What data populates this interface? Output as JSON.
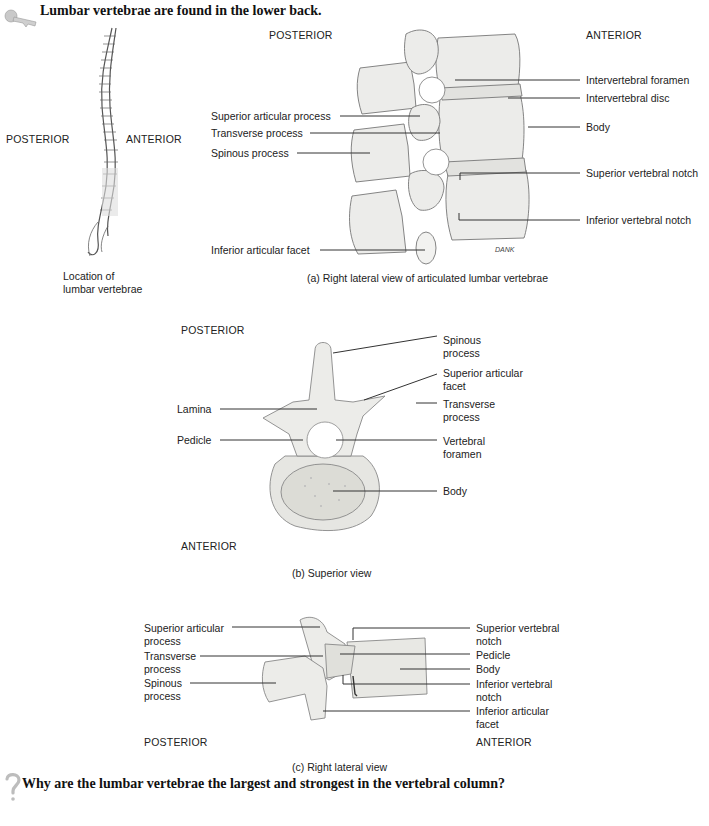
{
  "header": {
    "title": "Lumbar vertebrae are found in the lower back.",
    "key_icon": "key-icon"
  },
  "spine_panel": {
    "posterior": "POSTERIOR",
    "anterior": "ANTERIOR",
    "caption_line1": "Location of",
    "caption_line2": "lumbar vertebrae"
  },
  "panel_a": {
    "posterior": "POSTERIOR",
    "anterior": "ANTERIOR",
    "caption": "(a)  Right lateral view of articulated lumbar vertebrae",
    "signature": "DANK",
    "left_labels": [
      "Superior articular process",
      "Transverse process",
      "Spinous process",
      "Inferior articular facet"
    ],
    "right_labels": [
      "Intervertebral foramen",
      "Intervertebral disc",
      "Body",
      "Superior vertebral notch",
      "Inferior vertebral notch"
    ]
  },
  "panel_b": {
    "posterior": "POSTERIOR",
    "anterior": "ANTERIOR",
    "caption": "(b) Superior view",
    "left_labels": [
      "Lamina",
      "Pedicle"
    ],
    "right_labels": [
      "Spinous\nprocess",
      "Superior articular\nfacet",
      "Transverse\nprocess",
      "Vertebral\nforamen",
      "Body"
    ]
  },
  "panel_c": {
    "posterior": "POSTERIOR",
    "anterior": "ANTERIOR",
    "caption": "(c) Right lateral view",
    "left_labels": [
      "Superior articular\nprocess",
      "Transverse\nprocess",
      "Spinous\nprocess"
    ],
    "right_labels": [
      "Superior vertebral\nnotch",
      "Pedicle",
      "Body",
      "Inferior vertebral\nnotch",
      "Inferior articular\nfacet"
    ]
  },
  "footer": {
    "question": "Why are the lumbar vertebrae the largest and strongest in the vertebral column?",
    "question_icon": "question-mark-icon"
  }
}
